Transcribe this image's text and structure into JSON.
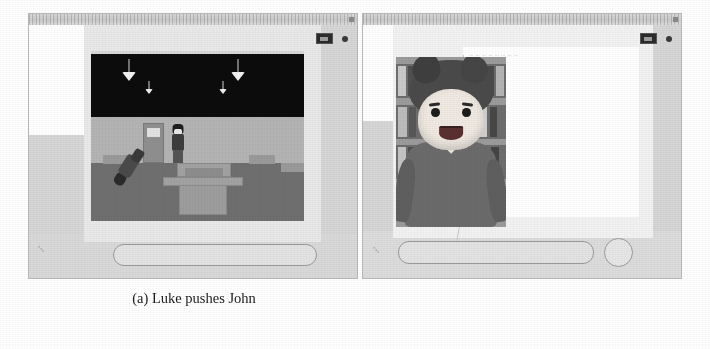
{
  "figure": {
    "type": "two-panel-screenshot-figure",
    "subfigures": [
      {
        "tag": "(a)",
        "caption": "(a) Luke pushes John",
        "app": {
          "titlebar": {
            "dot_icon": "window-dot-icon"
          },
          "controls": {
            "thumbnail_label": "camera-thumbnail",
            "dot_label": "record-dot"
          },
          "viewport": {
            "scene_name": "classroom-3d-scene",
            "description": "Dark ceiling with four hanging lamps, grey back wall with a door, rows of desks on a grey floor, one standing character and one fallen character",
            "lamps": 4,
            "characters": [
              "Luke",
              "John"
            ]
          },
          "input_bar": {
            "placeholder": "",
            "value": ""
          },
          "corner_icon": "keyboard-icon"
        }
      },
      {
        "tag": "(b)",
        "caption": "(b) The user interacts with John",
        "app": {
          "titlebar": {
            "dot_icon": "window-dot-icon"
          },
          "controls": {
            "thumbnail_label": "camera-thumbnail",
            "dot_label": "record-dot"
          },
          "avatar": {
            "name": "John",
            "description": "Cartoon avatar with spiky dark hair, large eyes and open smile, wearing a grey jacket, standing in front of bookshelves"
          },
          "dialogue": {
            "line1": "… … … … … … … …",
            "line2": "… … … … …"
          },
          "input_bar": {
            "placeholder": "",
            "value": ""
          },
          "send_button_label": "send-button",
          "corner_icon": "keyboard-icon"
        }
      }
    ]
  }
}
